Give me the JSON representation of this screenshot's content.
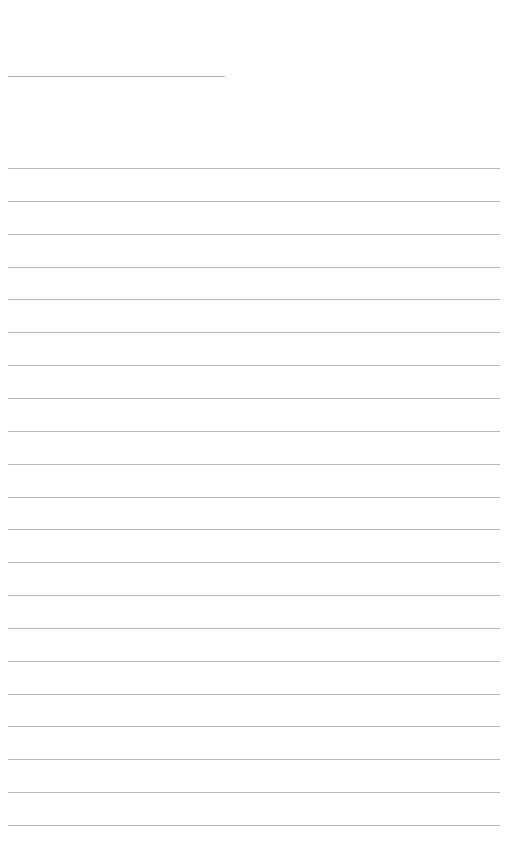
{
  "document": {
    "type": "blank ruled page",
    "background_color": "#ffffff",
    "line_color": "#b8b8b8",
    "header_line": {
      "label": "",
      "x": 8,
      "y": 76,
      "width": 217
    },
    "ruled_lines": {
      "count": 21,
      "x": 8,
      "first_y": 168,
      "spacing": 32.85,
      "width": 492,
      "values": [
        "",
        "",
        "",
        "",
        "",
        "",
        "",
        "",
        "",
        "",
        "",
        "",
        "",
        "",
        "",
        "",
        "",
        "",
        "",
        "",
        ""
      ]
    }
  }
}
